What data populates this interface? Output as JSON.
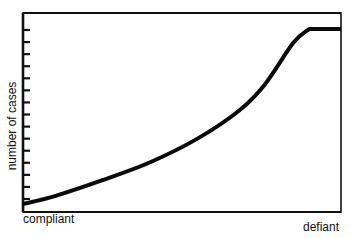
{
  "chart_data": {
    "type": "line",
    "title": "",
    "xlabel": "",
    "ylabel": "number of cases",
    "x_tick_labels": [
      "compliant",
      "defiant"
    ],
    "y_tick_labels": [],
    "y_tick_count": 15,
    "grid": false,
    "legend": null,
    "series": [
      {
        "name": "number of cases",
        "description": "Monotonically increasing curve from compliant to defiant, accelerating upward, then plateauing near the top",
        "x": [
          0.0,
          0.1,
          0.25,
          0.4,
          0.55,
          0.68,
          0.76,
          0.85,
          0.9,
          1.0
        ],
        "y": [
          0.04,
          0.08,
          0.16,
          0.25,
          0.37,
          0.51,
          0.64,
          0.85,
          0.92,
          0.92
        ]
      }
    ],
    "xlim": [
      0,
      1
    ],
    "ylim": [
      0,
      1
    ]
  }
}
